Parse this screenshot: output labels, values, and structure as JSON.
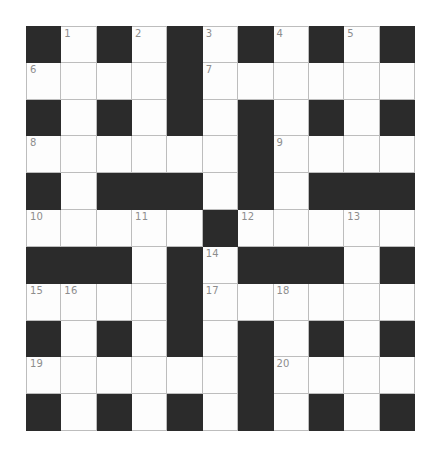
{
  "puzzle": {
    "kind": "crossword-grid",
    "rows": 11,
    "columns": 11,
    "colors": {
      "page_background": "#ffffff",
      "white_cell": "#fdfdfd",
      "black_cell": "#2b2b2b",
      "grid_line": "#bdbdbd",
      "number_text": "#8d8d8d"
    },
    "legend": {
      "white": ".",
      "black": "#"
    },
    "grid": [
      "#.#.#.#.#.#",
      "....#......",
      "#.#.#.#.#.#",
      "......#....",
      "#.###.#.###",
      ".....#.....",
      "###.#.###.#",
      "....#......",
      "#.#.#.#.#.#",
      "......#....",
      "#.#.#.#.#.#"
    ],
    "numbers": [
      {
        "label": "1",
        "row": 0,
        "col": 1
      },
      {
        "label": "2",
        "row": 0,
        "col": 3
      },
      {
        "label": "3",
        "row": 0,
        "col": 5
      },
      {
        "label": "4",
        "row": 0,
        "col": 7
      },
      {
        "label": "5",
        "row": 0,
        "col": 9
      },
      {
        "label": "6",
        "row": 1,
        "col": 0
      },
      {
        "label": "7",
        "row": 1,
        "col": 5
      },
      {
        "label": "8",
        "row": 3,
        "col": 0
      },
      {
        "label": "9",
        "row": 3,
        "col": 7
      },
      {
        "label": "10",
        "row": 5,
        "col": 0
      },
      {
        "label": "11",
        "row": 5,
        "col": 3
      },
      {
        "label": "12",
        "row": 5,
        "col": 6
      },
      {
        "label": "13",
        "row": 5,
        "col": 9
      },
      {
        "label": "14",
        "row": 6,
        "col": 5
      },
      {
        "label": "15",
        "row": 7,
        "col": 0
      },
      {
        "label": "16",
        "row": 7,
        "col": 1
      },
      {
        "label": "17",
        "row": 7,
        "col": 5
      },
      {
        "label": "18",
        "row": 7,
        "col": 7
      },
      {
        "label": "19",
        "row": 9,
        "col": 0
      },
      {
        "label": "20",
        "row": 9,
        "col": 7
      }
    ],
    "entries": []
  }
}
